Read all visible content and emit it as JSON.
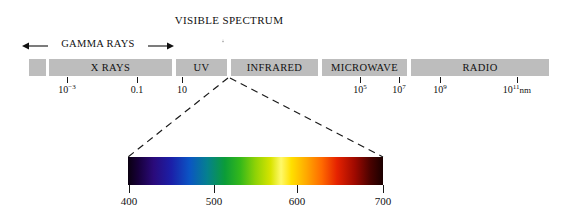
{
  "figure": {
    "visible_spectrum_label": "VISIBLE SPECTRUM",
    "gamma_label": "GAMMA RAYS",
    "unit_suffix": "nm"
  },
  "spectrum_bands": [
    {
      "label": "",
      "name": "band-gamma-stub",
      "left": 29,
      "width": 17
    },
    {
      "label": "X RAYS",
      "name": "band-x-rays",
      "left": 49,
      "width": 123
    },
    {
      "label": "UV",
      "name": "band-uv",
      "left": 176,
      "width": 51
    },
    {
      "label": "INFRARED",
      "name": "band-infrared",
      "left": 231,
      "width": 87
    },
    {
      "label": "MICROWAVE",
      "name": "band-microwave",
      "left": 322,
      "width": 85
    },
    {
      "label": "RADIO",
      "name": "band-radio",
      "left": 411,
      "width": 138
    }
  ],
  "spectrum_ticks": [
    {
      "name": "tick-1e-3",
      "x": 67,
      "mantissa": "10",
      "exponent": "−3",
      "plain": "",
      "unit": ""
    },
    {
      "name": "tick-0p1",
      "x": 137,
      "mantissa": "",
      "exponent": "",
      "plain": "0.1",
      "unit": ""
    },
    {
      "name": "tick-10",
      "x": 182,
      "mantissa": "",
      "exponent": "",
      "plain": "10",
      "unit": ""
    },
    {
      "name": "tick-1e5",
      "x": 360,
      "mantissa": "10",
      "exponent": "5",
      "plain": "",
      "unit": ""
    },
    {
      "name": "tick-1e7",
      "x": 399,
      "mantissa": "10",
      "exponent": "7",
      "plain": "",
      "unit": ""
    },
    {
      "name": "tick-1e9",
      "x": 440,
      "mantissa": "10",
      "exponent": "9",
      "plain": "",
      "unit": ""
    },
    {
      "name": "tick-1e11",
      "x": 517,
      "mantissa": "10",
      "exponent": "11",
      "plain": "",
      "unit": "nm"
    }
  ],
  "wavelength_ticks": [
    {
      "name": "wavelength-tick-400",
      "x": 129,
      "label": "400"
    },
    {
      "name": "wavelength-tick-500",
      "x": 214,
      "label": "500"
    },
    {
      "name": "wavelength-tick-600",
      "x": 297,
      "label": "600"
    },
    {
      "name": "wavelength-tick-700",
      "x": 383,
      "label": "700"
    }
  ],
  "chart_data": {
    "type": "bar",
    "xlabel": "Wavelength (nm)",
    "ylabel": "",
    "grid": false,
    "legend": "none",
    "axis_scale": "log10",
    "categories": [
      "GAMMA RAYS",
      "X RAYS",
      "UV",
      "INFRARED",
      "MICROWAVE",
      "RADIO"
    ],
    "axis_tick_labels": [
      "10^-3",
      "0.1",
      "10",
      "10^5",
      "10^7",
      "10^9",
      "10^11 nm"
    ],
    "axis_tick_values": [
      0.001,
      0.1,
      10,
      100000,
      10000000,
      1000000000,
      100000000000
    ],
    "visible_detail": {
      "label": "VISIBLE SPECTRUM",
      "tick_labels": [
        "400",
        "500",
        "600",
        "700"
      ],
      "tick_values": [
        400,
        500,
        600,
        700
      ],
      "xlim": [
        400,
        700
      ],
      "colors": [
        "violet",
        "blue",
        "cyan",
        "green",
        "yellow",
        "orange",
        "red"
      ]
    },
    "colors": {
      "band_fill": "#bdbdbd",
      "text": "#111111",
      "background": "#ffffff"
    }
  }
}
